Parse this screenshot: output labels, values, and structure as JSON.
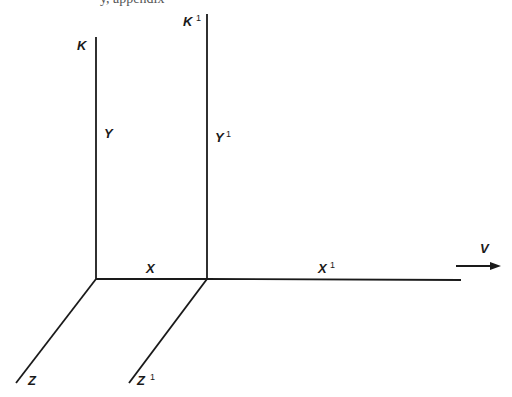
{
  "cut_off_text": "y, appendix",
  "frames": {
    "stationary": {
      "name": "K",
      "axes": {
        "x": "X",
        "y": "Y",
        "z": "Z"
      },
      "origin": [
        96,
        279
      ]
    },
    "moving": {
      "name": "K",
      "superscript": "1",
      "axes": {
        "x": "X",
        "y": "Y",
        "z": "Z"
      },
      "axis_superscript": "1",
      "origin": [
        207,
        279
      ]
    }
  },
  "velocity": {
    "label": "V",
    "direction": "right"
  },
  "colors": {
    "line": "#1a1a1a",
    "background": "#ffffff"
  }
}
